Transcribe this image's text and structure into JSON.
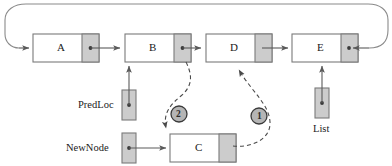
{
  "diagram": {
    "colors": {
      "stroke": "#6f6f6f",
      "stroke_dark": "#4a4a4a",
      "pointer_fill": "#c9c9c9",
      "node_fill": "#ffffff",
      "circle_fill": "#b5b5b5",
      "text": "#1a1a1a",
      "dashed": "#555555"
    },
    "nodes": [
      {
        "id": "A",
        "label": "A",
        "x": 33,
        "y": 34,
        "w": 66,
        "h": 28,
        "ptr_w": 17
      },
      {
        "id": "B",
        "label": "B",
        "x": 125,
        "y": 34,
        "w": 66,
        "h": 28,
        "ptr_w": 17
      },
      {
        "id": "D",
        "label": "D",
        "x": 206,
        "y": 34,
        "w": 66,
        "h": 28,
        "ptr_w": 17
      },
      {
        "id": "E",
        "label": "E",
        "x": 292,
        "y": 34,
        "w": 66,
        "h": 28,
        "ptr_w": 17
      },
      {
        "id": "C",
        "label": "C",
        "x": 170,
        "y": 134,
        "w": 66,
        "h": 28,
        "ptr_w": 17
      }
    ],
    "pointer_vars": [
      {
        "id": "predloc",
        "label": "PredLoc",
        "box_x": 122,
        "box_y": 90,
        "box_w": 14,
        "box_h": 30,
        "label_x": 78,
        "label_y": 100,
        "label_pos": "left"
      },
      {
        "id": "newnode",
        "label": "NewNode",
        "box_x": 122,
        "box_y": 133,
        "box_w": 14,
        "box_h": 30,
        "label_x": 68,
        "label_y": 143,
        "label_pos": "left"
      },
      {
        "id": "list",
        "label": "List",
        "box_x": 315,
        "box_y": 88,
        "box_w": 14,
        "box_h": 30,
        "label_x": 310,
        "label_y": 124,
        "label_pos": "below"
      }
    ],
    "step_markers": [
      {
        "id": "step-1",
        "label": "1",
        "cx": 259,
        "cy": 116,
        "r": 8
      },
      {
        "id": "step-2",
        "label": "2",
        "cx": 179,
        "cy": 114,
        "r": 8
      }
    ],
    "captions": {
      "predloc": "PredLoc",
      "newnode": "NewNode",
      "list": "List",
      "step_one": "1",
      "step_two": "2"
    }
  }
}
